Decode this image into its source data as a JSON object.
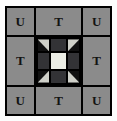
{
  "figure": {
    "name": "quilt-block-diagram",
    "background_color": "#fdfdfd"
  },
  "outer_frame": {
    "border_color": "#000000",
    "cell_color": "#8b8b8b",
    "label_color": "#131313",
    "cells": [
      {
        "position": "top-left",
        "label": "U",
        "type": "corner"
      },
      {
        "position": "top-center",
        "label": "T",
        "type": "edge"
      },
      {
        "position": "top-right",
        "label": "U",
        "type": "corner"
      },
      {
        "position": "middle-left",
        "label": "T",
        "type": "edge"
      },
      {
        "position": "center",
        "label": "",
        "type": "inner-block"
      },
      {
        "position": "middle-right",
        "label": "T",
        "type": "edge"
      },
      {
        "position": "bottom-left",
        "label": "U",
        "type": "corner"
      },
      {
        "position": "bottom-center",
        "label": "T",
        "type": "edge"
      },
      {
        "position": "bottom-right",
        "label": "U",
        "type": "corner"
      }
    ]
  },
  "inner_block": {
    "grid": "3x3",
    "colors": {
      "dark": "#111111",
      "light_triangle": "#cfd0c9",
      "bar": "#333336",
      "center": "#eceee6",
      "seam": "#000000"
    },
    "units": [
      {
        "position": "top-left",
        "type": "half-square-triangle",
        "triangle": "upper-right"
      },
      {
        "position": "top-center",
        "type": "rectangle-bar",
        "triangle": ""
      },
      {
        "position": "top-right",
        "type": "half-square-triangle",
        "triangle": "upper-left"
      },
      {
        "position": "middle-left",
        "type": "rectangle-bar",
        "triangle": ""
      },
      {
        "position": "center",
        "type": "plain-square",
        "triangle": ""
      },
      {
        "position": "middle-right",
        "type": "rectangle-bar",
        "triangle": ""
      },
      {
        "position": "bottom-left",
        "type": "half-square-triangle",
        "triangle": "lower-right"
      },
      {
        "position": "bottom-center",
        "type": "rectangle-bar",
        "triangle": ""
      },
      {
        "position": "bottom-right",
        "type": "half-square-triangle",
        "triangle": "lower-left"
      }
    ]
  }
}
